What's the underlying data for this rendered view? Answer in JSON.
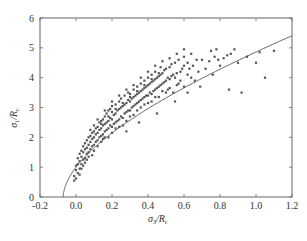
{
  "chart_data": {
    "type": "scatter",
    "title": "",
    "xlabel": "σ3/Rc",
    "ylabel": "σ1/Rc",
    "xlabel_parts": {
      "main": "σ",
      "sub1": "3",
      "slash": "/",
      "R": "R",
      "sub2": "c"
    },
    "ylabel_parts": {
      "main": "σ",
      "sub1": "1",
      "slash": "/",
      "R": "R",
      "sub2": "c"
    },
    "xlim": [
      -0.2,
      1.2
    ],
    "ylim": [
      0,
      6
    ],
    "xticks": [
      "-0.2",
      "0.0",
      "0.2",
      "0.4",
      "0.6",
      "0.8",
      "1.0",
      "1.2"
    ],
    "xtick_values": [
      -0.2,
      0.0,
      0.2,
      0.4,
      0.6,
      0.8,
      1.0,
      1.2
    ],
    "yticks": [
      "0",
      "1",
      "2",
      "3",
      "4",
      "5",
      "6"
    ],
    "ytick_values": [
      0,
      1,
      2,
      3,
      4,
      5,
      6
    ],
    "grid": false,
    "legend": null,
    "colors": {
      "points": "#555555",
      "curve": "#555555",
      "axes": "#666666"
    },
    "fit_curve": {
      "name": "Hoek-Brown fit",
      "equation": "σ1/Rc = σ3/Rc + sqrt(m·σ3/Rc + s)",
      "m": 13.9,
      "s": 1.0,
      "x_start": -0.072,
      "x_end": 1.2
    },
    "series": [
      {
        "name": "test data",
        "points": [
          [
            -0.01,
            0.55
          ],
          [
            -0.01,
            0.7
          ],
          [
            0.0,
            0.62
          ],
          [
            0.0,
            0.9
          ],
          [
            0.0,
            1.05
          ],
          [
            0.01,
            0.8
          ],
          [
            0.01,
            1.1
          ],
          [
            0.01,
            1.3
          ],
          [
            0.02,
            0.95
          ],
          [
            0.02,
            1.2
          ],
          [
            0.02,
            1.45
          ],
          [
            0.03,
            1.1
          ],
          [
            0.03,
            1.35
          ],
          [
            0.03,
            1.55
          ],
          [
            0.04,
            1.25
          ],
          [
            0.04,
            1.5
          ],
          [
            0.04,
            1.7
          ],
          [
            0.05,
            1.3
          ],
          [
            0.05,
            1.6
          ],
          [
            0.05,
            1.8
          ],
          [
            0.06,
            1.45
          ],
          [
            0.06,
            1.65
          ],
          [
            0.06,
            1.9
          ],
          [
            0.07,
            1.5
          ],
          [
            0.07,
            1.75
          ],
          [
            0.07,
            2.0
          ],
          [
            0.08,
            1.6
          ],
          [
            0.08,
            1.85
          ],
          [
            0.08,
            2.05
          ],
          [
            0.09,
            1.7
          ],
          [
            0.09,
            1.95
          ],
          [
            0.09,
            2.15
          ],
          [
            0.1,
            1.75
          ],
          [
            0.1,
            2.0
          ],
          [
            0.1,
            2.2
          ],
          [
            0.1,
            2.4
          ],
          [
            0.11,
            1.85
          ],
          [
            0.11,
            2.1
          ],
          [
            0.11,
            2.3
          ],
          [
            0.12,
            1.9
          ],
          [
            0.12,
            2.15
          ],
          [
            0.12,
            2.35
          ],
          [
            0.13,
            2.0
          ],
          [
            0.13,
            2.25
          ],
          [
            0.13,
            2.5
          ],
          [
            0.14,
            2.05
          ],
          [
            0.14,
            2.3
          ],
          [
            0.14,
            2.55
          ],
          [
            0.15,
            2.1
          ],
          [
            0.15,
            2.4
          ],
          [
            0.15,
            2.6
          ],
          [
            0.16,
            2.2
          ],
          [
            0.16,
            2.45
          ],
          [
            0.16,
            2.7
          ],
          [
            0.17,
            2.25
          ],
          [
            0.17,
            2.5
          ],
          [
            0.17,
            2.8
          ],
          [
            0.18,
            2.3
          ],
          [
            0.18,
            2.55
          ],
          [
            0.18,
            2.9
          ],
          [
            0.19,
            2.4
          ],
          [
            0.19,
            2.65
          ],
          [
            0.19,
            2.95
          ],
          [
            0.2,
            2.35
          ],
          [
            0.2,
            2.6
          ],
          [
            0.2,
            2.85
          ],
          [
            0.2,
            3.05
          ],
          [
            0.21,
            2.45
          ],
          [
            0.21,
            2.75
          ],
          [
            0.22,
            2.5
          ],
          [
            0.22,
            2.8
          ],
          [
            0.22,
            3.1
          ],
          [
            0.23,
            2.55
          ],
          [
            0.23,
            2.9
          ],
          [
            0.24,
            2.6
          ],
          [
            0.24,
            2.95
          ],
          [
            0.24,
            3.2
          ],
          [
            0.25,
            2.7
          ],
          [
            0.25,
            3.0
          ],
          [
            0.25,
            3.3
          ],
          [
            0.26,
            2.65
          ],
          [
            0.26,
            3.05
          ],
          [
            0.27,
            2.8
          ],
          [
            0.27,
            3.1
          ],
          [
            0.27,
            3.4
          ],
          [
            0.28,
            2.85
          ],
          [
            0.28,
            3.15
          ],
          [
            0.29,
            2.9
          ],
          [
            0.29,
            3.25
          ],
          [
            0.29,
            3.5
          ],
          [
            0.3,
            2.9
          ],
          [
            0.3,
            3.2
          ],
          [
            0.3,
            3.45
          ],
          [
            0.31,
            3.0
          ],
          [
            0.31,
            3.3
          ],
          [
            0.32,
            3.05
          ],
          [
            0.32,
            3.35
          ],
          [
            0.32,
            3.6
          ],
          [
            0.33,
            3.1
          ],
          [
            0.33,
            3.4
          ],
          [
            0.34,
            3.15
          ],
          [
            0.34,
            3.45
          ],
          [
            0.34,
            3.7
          ],
          [
            0.35,
            3.2
          ],
          [
            0.35,
            3.5
          ],
          [
            0.36,
            3.25
          ],
          [
            0.36,
            3.55
          ],
          [
            0.36,
            3.8
          ],
          [
            0.37,
            3.3
          ],
          [
            0.37,
            3.6
          ],
          [
            0.38,
            3.35
          ],
          [
            0.38,
            3.65
          ],
          [
            0.38,
            3.9
          ],
          [
            0.39,
            3.4
          ],
          [
            0.39,
            3.7
          ],
          [
            0.4,
            3.4
          ],
          [
            0.4,
            3.75
          ],
          [
            0.4,
            4.0
          ],
          [
            0.41,
            3.5
          ],
          [
            0.41,
            3.8
          ],
          [
            0.42,
            3.45
          ],
          [
            0.42,
            3.85
          ],
          [
            0.42,
            4.1
          ],
          [
            0.43,
            3.55
          ],
          [
            0.43,
            3.9
          ],
          [
            0.44,
            3.6
          ],
          [
            0.44,
            3.95
          ],
          [
            0.44,
            4.2
          ],
          [
            0.45,
            3.65
          ],
          [
            0.45,
            4.0
          ],
          [
            0.46,
            3.7
          ],
          [
            0.46,
            4.05
          ],
          [
            0.47,
            3.75
          ],
          [
            0.47,
            4.1
          ],
          [
            0.47,
            4.35
          ],
          [
            0.48,
            3.8
          ],
          [
            0.48,
            4.15
          ],
          [
            0.49,
            3.85
          ],
          [
            0.49,
            4.25
          ],
          [
            0.5,
            3.9
          ],
          [
            0.5,
            4.3
          ],
          [
            0.51,
            3.6
          ],
          [
            0.51,
            4.0
          ],
          [
            0.52,
            3.95
          ],
          [
            0.52,
            4.35
          ],
          [
            0.53,
            4.05
          ],
          [
            0.53,
            4.45
          ],
          [
            0.54,
            3.5
          ],
          [
            0.54,
            4.1
          ],
          [
            0.55,
            4.0
          ],
          [
            0.55,
            4.5
          ],
          [
            0.56,
            4.15
          ],
          [
            0.57,
            3.8
          ],
          [
            0.57,
            4.6
          ],
          [
            0.58,
            4.2
          ],
          [
            0.59,
            4.3
          ],
          [
            0.6,
            3.7
          ],
          [
            0.6,
            4.4
          ],
          [
            0.6,
            4.7
          ],
          [
            0.62,
            4.5
          ],
          [
            0.62,
            4.1
          ],
          [
            0.63,
            4.3
          ],
          [
            0.64,
            4.8
          ],
          [
            0.65,
            4.4
          ],
          [
            0.66,
            3.9
          ],
          [
            0.67,
            4.6
          ],
          [
            0.68,
            4.2
          ],
          [
            0.69,
            3.7
          ],
          [
            0.7,
            4.6
          ],
          [
            0.72,
            4.3
          ],
          [
            0.74,
            4.55
          ],
          [
            0.75,
            4.9
          ],
          [
            0.76,
            4.1
          ],
          [
            0.77,
            4.7
          ],
          [
            0.78,
            4.95
          ],
          [
            0.79,
            4.6
          ],
          [
            0.8,
            4.4
          ],
          [
            0.82,
            4.65
          ],
          [
            0.84,
            4.75
          ],
          [
            0.85,
            3.6
          ],
          [
            0.86,
            4.8
          ],
          [
            0.88,
            4.95
          ],
          [
            0.9,
            4.5
          ],
          [
            0.92,
            3.5
          ],
          [
            0.95,
            4.7
          ],
          [
            1.0,
            4.5
          ],
          [
            1.02,
            4.85
          ],
          [
            1.05,
            4.0
          ],
          [
            1.1,
            4.9
          ],
          [
            0.18,
            2.0
          ],
          [
            0.22,
            2.3
          ],
          [
            0.26,
            2.4
          ],
          [
            0.3,
            2.7
          ],
          [
            0.34,
            2.9
          ],
          [
            0.38,
            3.1
          ],
          [
            0.42,
            3.2
          ],
          [
            0.46,
            3.35
          ],
          [
            0.5,
            3.5
          ],
          [
            0.58,
            3.9
          ],
          [
            0.64,
            4.0
          ],
          [
            0.07,
            1.35
          ],
          [
            0.05,
            1.15
          ],
          [
            0.03,
            0.95
          ],
          [
            0.12,
            1.7
          ],
          [
            0.14,
            1.85
          ],
          [
            0.16,
            2.0
          ],
          [
            0.2,
            2.15
          ],
          [
            0.24,
            2.35
          ],
          [
            0.28,
            2.55
          ],
          [
            0.32,
            2.75
          ],
          [
            0.36,
            3.0
          ],
          [
            0.4,
            3.15
          ],
          [
            0.44,
            3.35
          ],
          [
            0.48,
            3.55
          ],
          [
            0.52,
            3.65
          ],
          [
            0.56,
            3.75
          ],
          [
            0.08,
            2.25
          ],
          [
            0.12,
            2.6
          ],
          [
            0.16,
            2.9
          ],
          [
            0.2,
            3.2
          ],
          [
            0.24,
            3.4
          ],
          [
            0.28,
            3.6
          ],
          [
            0.32,
            3.75
          ],
          [
            0.36,
            4.0
          ],
          [
            0.4,
            4.2
          ],
          [
            0.44,
            4.4
          ],
          [
            0.48,
            4.55
          ],
          [
            0.52,
            4.65
          ],
          [
            0.56,
            4.8
          ],
          [
            0.6,
            4.95
          ],
          [
            0.1,
            1.55
          ],
          [
            0.14,
            2.45
          ],
          [
            0.18,
            2.7
          ],
          [
            0.22,
            2.95
          ],
          [
            0.26,
            3.15
          ],
          [
            0.3,
            3.35
          ],
          [
            0.34,
            3.55
          ],
          [
            0.38,
            3.75
          ],
          [
            0.42,
            3.95
          ],
          [
            0.46,
            4.15
          ],
          [
            0.35,
            2.5
          ],
          [
            0.45,
            2.8
          ],
          [
            0.55,
            3.2
          ],
          [
            0.62,
            3.5
          ],
          [
            0.28,
            2.2
          ],
          [
            0.15,
            1.95
          ],
          [
            0.09,
            1.4
          ],
          [
            0.06,
            1.25
          ],
          [
            0.04,
            1.05
          ],
          [
            0.02,
            0.75
          ]
        ]
      }
    ]
  }
}
